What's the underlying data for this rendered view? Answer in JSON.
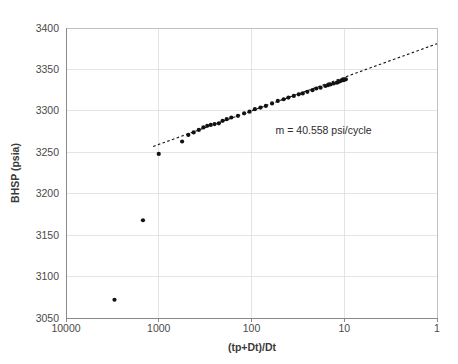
{
  "chart_data": {
    "type": "scatter",
    "title": "",
    "subtitle": "",
    "xlabel": "(tp+Dt)/Dt",
    "ylabel": "BHSP (psia)",
    "x_scale": "log",
    "x_reversed": true,
    "xlim": [
      10000,
      1
    ],
    "ylim": [
      3050,
      3400
    ],
    "grid": true,
    "legend": null,
    "x_ticks": [
      "10000",
      "1000",
      "100",
      "10",
      "1"
    ],
    "x_tick_values": [
      10000,
      1000,
      100,
      10,
      1
    ],
    "y_ticks": [
      "3050",
      "3100",
      "3150",
      "3200",
      "3250",
      "3300",
      "3350",
      "3400"
    ],
    "y_tick_values": [
      3050,
      3100,
      3150,
      3200,
      3250,
      3300,
      3350,
      3400
    ],
    "annotations": [
      {
        "text": "m = 40.558 psi/cycle",
        "x": 55,
        "y": 3272
      }
    ],
    "slope_psi_per_cycle": 40.558,
    "series": [
      {
        "name": "BHSP data",
        "marker": "filled-circle",
        "color": "#121212",
        "points": [
          [
            3000,
            3072
          ],
          [
            1480,
            3168
          ],
          [
            1000,
            3248
          ],
          [
            560,
            3263
          ],
          [
            480,
            3271
          ],
          [
            420,
            3274
          ],
          [
            370,
            3277
          ],
          [
            330,
            3280
          ],
          [
            300,
            3282
          ],
          [
            275,
            3283
          ],
          [
            250,
            3284
          ],
          [
            225,
            3285
          ],
          [
            205,
            3288
          ],
          [
            185,
            3290
          ],
          [
            165,
            3292
          ],
          [
            140,
            3294
          ],
          [
            120,
            3297
          ],
          [
            105,
            3299
          ],
          [
            92,
            3302
          ],
          [
            80,
            3304
          ],
          [
            70,
            3306
          ],
          [
            60,
            3309
          ],
          [
            52,
            3312
          ],
          [
            45,
            3314
          ],
          [
            40,
            3316
          ],
          [
            35,
            3318
          ],
          [
            31,
            3320
          ],
          [
            28,
            3321
          ],
          [
            25,
            3323
          ],
          [
            22,
            3325
          ],
          [
            20,
            3327
          ],
          [
            18,
            3328
          ],
          [
            16,
            3330
          ],
          [
            15,
            3331
          ],
          [
            14,
            3332
          ],
          [
            13,
            3333
          ],
          [
            12,
            3334
          ],
          [
            11.5,
            3335
          ],
          [
            11,
            3336
          ],
          [
            10.6,
            3337
          ],
          [
            10.2,
            3337
          ],
          [
            9.9,
            3338
          ],
          [
            9.6,
            3338
          ]
        ]
      }
    ],
    "trendline": {
      "name": "semilog straight line",
      "style": "dashed",
      "color": "#1a1a1a",
      "x_start": 1150,
      "y_start": 3257,
      "x_end": 1.0,
      "y_end": 3381
    }
  }
}
